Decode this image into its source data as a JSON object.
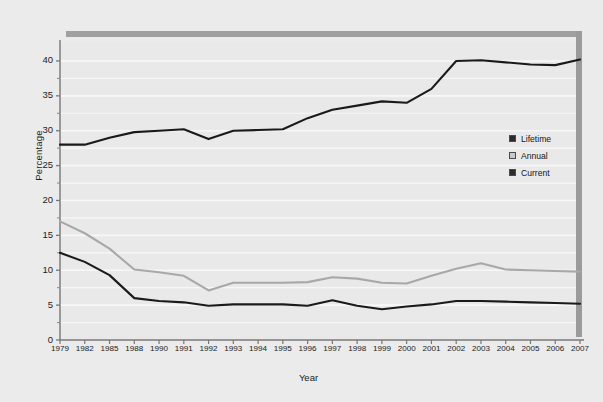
{
  "chart_data": {
    "type": "line",
    "title": "",
    "xlabel": "Year",
    "ylabel": "Percentage",
    "xlim": [
      1979,
      2007
    ],
    "ylim": [
      0,
      42
    ],
    "yticks": [
      0,
      5,
      10,
      15,
      20,
      25,
      30,
      35,
      40
    ],
    "grid": true,
    "grid_minor_step": 2.5,
    "legend_position": "right",
    "categories": [
      "1979",
      "1982",
      "1985",
      "1988",
      "1990",
      "1991",
      "1992",
      "1993",
      "1994",
      "1995",
      "1996",
      "1997",
      "1998",
      "1999",
      "2000",
      "2001",
      "2002",
      "2003",
      "2004",
      "2005",
      "2006",
      "2007"
    ],
    "series": [
      {
        "name": "Lifetime",
        "color": "#1a1a1a",
        "values": [
          28.0,
          28.0,
          29.0,
          29.8,
          30.0,
          30.2,
          28.8,
          30.0,
          30.1,
          30.2,
          31.8,
          33.0,
          33.6,
          34.2,
          34.0,
          36.0,
          40.0,
          40.1,
          39.8,
          39.5,
          39.4,
          40.2
        ]
      },
      {
        "name": "Annual",
        "color": "#a8a8a8",
        "values": [
          17.0,
          15.3,
          13.1,
          10.1,
          9.7,
          9.2,
          7.1,
          8.2,
          8.2,
          8.2,
          8.3,
          9.0,
          8.8,
          8.2,
          8.1,
          9.2,
          10.2,
          11.0,
          10.1,
          10.0,
          9.9,
          9.8
        ]
      },
      {
        "name": "Current",
        "color": "#1a1a1a",
        "values": [
          12.5,
          11.2,
          9.3,
          6.0,
          5.6,
          5.4,
          4.9,
          5.1,
          5.1,
          5.1,
          4.9,
          5.7,
          4.9,
          4.4,
          4.8,
          5.1,
          5.6,
          5.6,
          5.5,
          5.4,
          5.3,
          5.2
        ]
      }
    ],
    "legend": [
      {
        "label": "Lifetime",
        "color": "#2b2b2b"
      },
      {
        "label": "Annual",
        "color": "#c9c9c9"
      },
      {
        "label": "Current",
        "color": "#2b2b2b"
      }
    ],
    "decorations": {
      "top_bar_color": "#a0a0a0",
      "right_bar_color": "#9a9a9a"
    }
  },
  "axes": {
    "ylabel": "Percentage",
    "xlabel": "Year",
    "ytick_labels": [
      "40",
      "35",
      "30",
      "25",
      "20",
      "15",
      "10",
      "5",
      "0"
    ]
  }
}
